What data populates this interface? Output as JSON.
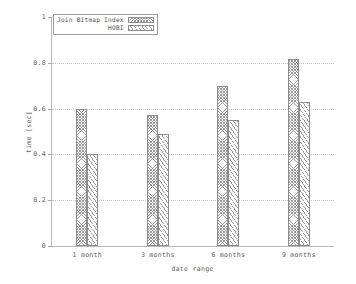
{
  "chart_data": {
    "type": "bar",
    "title": "",
    "subtitle": "",
    "xlabel": "date range",
    "ylabel": "time [sec]",
    "categories": [
      "1 month",
      "3 months",
      "6 months",
      "9 months"
    ],
    "series": [
      {
        "name": "Join Bitmap Index",
        "values": [
          0.6,
          0.57,
          0.7,
          0.815
        ],
        "pattern": "crosshatch"
      },
      {
        "name": "HOBI",
        "values": [
          0.4,
          0.49,
          0.55,
          0.63
        ],
        "pattern": "diagonal"
      }
    ],
    "ylim": [
      0,
      1
    ],
    "yticks": [
      0,
      0.2,
      0.4,
      0.6,
      0.8,
      1
    ],
    "ytick_labels": [
      "0",
      "0.2",
      "0.4",
      "0.6",
      "0.8",
      "1"
    ],
    "grid": true,
    "grid_axis": "y",
    "legend_position": "top-left-inside",
    "colors": {
      "axis": "#b9b9b9",
      "grid": "#c9c9c9",
      "bar_outline": "#8d8d8d",
      "text": "#5d5d5d",
      "background": "#ffffff"
    }
  },
  "legend": {
    "items": [
      {
        "label": "Join Bitmap Index"
      },
      {
        "label": "HOBI"
      }
    ]
  }
}
